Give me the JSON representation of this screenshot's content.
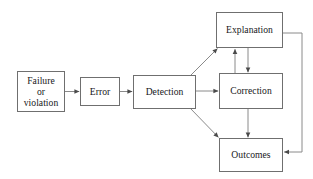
{
  "diagram": {
    "type": "flowchart",
    "background_color": "#ffffff",
    "box_border_color": "#6f6f6f",
    "edge_color": "#7a7a7a",
    "text_color": "#17171a",
    "nodes": [
      {
        "id": "failure",
        "label": "Failure\nor\nviolation",
        "x": 17,
        "y": 71,
        "w": 48,
        "h": 41
      },
      {
        "id": "error",
        "label": "Error",
        "x": 80,
        "y": 77,
        "w": 40,
        "h": 29
      },
      {
        "id": "detection",
        "label": "Detection",
        "x": 133,
        "y": 75,
        "w": 63,
        "h": 34
      },
      {
        "id": "explanation",
        "label": "Explanation",
        "x": 216,
        "y": 12,
        "w": 67,
        "h": 36
      },
      {
        "id": "correction",
        "label": "Correction",
        "x": 219,
        "y": 73,
        "w": 64,
        "h": 36
      },
      {
        "id": "outcomes",
        "label": "Outcomes",
        "x": 219,
        "y": 138,
        "w": 64,
        "h": 34
      }
    ],
    "edges": [
      {
        "id": "failure-to-error",
        "from": "failure",
        "to": "error",
        "style": "straight",
        "arrow": true
      },
      {
        "id": "error-to-detection",
        "from": "error",
        "to": "detection",
        "style": "straight",
        "arrow": true
      },
      {
        "id": "detection-to-explanation",
        "from": "detection",
        "to": "explanation",
        "style": "diagonal",
        "arrow": true
      },
      {
        "id": "detection-to-correction",
        "from": "detection",
        "to": "correction",
        "style": "straight",
        "arrow": true
      },
      {
        "id": "detection-to-outcomes",
        "from": "detection",
        "to": "outcomes",
        "style": "diagonal",
        "arrow": true
      },
      {
        "id": "correction-to-explanation",
        "from": "correction",
        "to": "explanation",
        "style": "vertical",
        "arrow": true
      },
      {
        "id": "explanation-to-correction",
        "from": "explanation",
        "to": "correction",
        "style": "vertical",
        "arrow": true
      },
      {
        "id": "correction-to-outcomes",
        "from": "correction",
        "to": "outcomes",
        "style": "vertical",
        "arrow": true
      },
      {
        "id": "explanation-to-outcomes",
        "from": "explanation",
        "to": "outcomes",
        "style": "elbow-right",
        "arrow": true
      }
    ]
  }
}
